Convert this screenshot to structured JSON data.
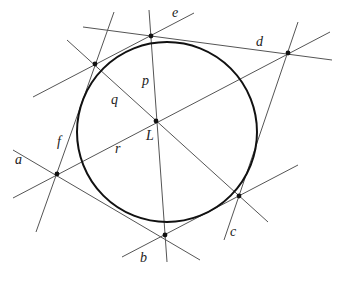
{
  "diagram": {
    "type": "geometry",
    "colors": {
      "stroke": "#555555",
      "circle": "#111111",
      "point": "#111111",
      "background": "#ffffff"
    },
    "circle": {
      "cx": 167,
      "cy": 132,
      "r": 90
    },
    "points": [
      {
        "name": "top",
        "x": 151,
        "y": 36
      },
      {
        "name": "upper-left",
        "x": 95,
        "y": 64
      },
      {
        "name": "L",
        "x": 156,
        "y": 121
      },
      {
        "name": "left",
        "x": 57,
        "y": 174
      },
      {
        "name": "bottom",
        "x": 165,
        "y": 235
      },
      {
        "name": "lower-right",
        "x": 239,
        "y": 196
      },
      {
        "name": "upper-right",
        "x": 288,
        "y": 53
      }
    ],
    "lines": [
      {
        "name": "a",
        "x1": 13,
        "y1": 150,
        "x2": 200,
        "y2": 260
      },
      {
        "name": "b",
        "x1": 122,
        "y1": 257,
        "x2": 298,
        "y2": 165
      },
      {
        "name": "c",
        "x1": 224,
        "y1": 240,
        "x2": 298,
        "y2": 22
      },
      {
        "name": "d",
        "x1": 83,
        "y1": 27,
        "x2": 332,
        "y2": 60
      },
      {
        "name": "e",
        "x1": 33,
        "y1": 97,
        "x2": 194,
        "y2": 13
      },
      {
        "name": "f",
        "x1": 36,
        "y1": 232,
        "x2": 114,
        "y2": 12
      },
      {
        "name": "p",
        "x1": 149,
        "y1": 10,
        "x2": 167,
        "y2": 262
      },
      {
        "name": "q",
        "x1": 67,
        "y1": 40,
        "x2": 268,
        "y2": 222
      },
      {
        "name": "r",
        "x1": 13,
        "y1": 198,
        "x2": 330,
        "y2": 32
      }
    ],
    "labels": [
      {
        "text": "a",
        "x": 15,
        "y": 164
      },
      {
        "text": "b",
        "x": 140,
        "y": 262
      },
      {
        "text": "c",
        "x": 230,
        "y": 236
      },
      {
        "text": "d",
        "x": 256,
        "y": 46
      },
      {
        "text": "e",
        "x": 172,
        "y": 17
      },
      {
        "text": "f",
        "x": 57,
        "y": 146
      },
      {
        "text": "p",
        "x": 142,
        "y": 85
      },
      {
        "text": "q",
        "x": 111,
        "y": 104
      },
      {
        "text": "r",
        "x": 115,
        "y": 153
      },
      {
        "text": "L",
        "x": 146,
        "y": 140
      }
    ]
  }
}
